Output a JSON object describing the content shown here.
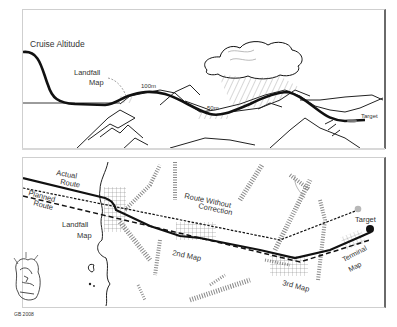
{
  "profile_view": {
    "labels": {
      "cruise_altitude": "Cruise Altitude",
      "landfall_map_line1": "Landfall",
      "landfall_map_line2": "Map",
      "altitude_100m": "100m",
      "altitude_50m": "50m",
      "target": "Target"
    }
  },
  "plan_view": {
    "labels": {
      "actual_route_line1": "Actual",
      "actual_route_line2": "Route",
      "planned_route_line1": "Planned",
      "planned_route_line2": "Route",
      "route_without_correction_line1": "Route Without",
      "route_without_correction_line2": "Correction",
      "landfall_map_line1": "Landfall",
      "landfall_map_line2": "Map",
      "second_map": "2nd Map",
      "third_map": "3rd Map",
      "terminal_map_line1": "Terminal",
      "terminal_map_line2": "Map",
      "target": "Target"
    }
  },
  "signature": {
    "text": "GB 2008"
  },
  "colors": {
    "line": "#111111",
    "hatch": "#8a8a8a",
    "frame_right": "#6a6a6a",
    "target_marker": "#111111",
    "uncorrected_target": "#b8b8b8"
  }
}
